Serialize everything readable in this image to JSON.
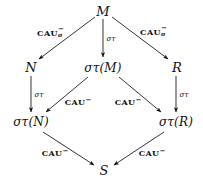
{
  "diagram": {
    "type": "commutative-diagram",
    "background_color": "#ffffff",
    "ink_color": "#111111",
    "nodes": [
      {
        "id": "M",
        "label": "M",
        "x": 103,
        "y": 11
      },
      {
        "id": "N",
        "label": "N",
        "x": 31,
        "y": 67
      },
      {
        "id": "sM",
        "label": "στ(M)",
        "x": 103,
        "y": 68
      },
      {
        "id": "R",
        "label": "R",
        "x": 177,
        "y": 67
      },
      {
        "id": "sN",
        "label": "στ(N)",
        "x": 31,
        "y": 122
      },
      {
        "id": "sR",
        "label": "στ(R)",
        "x": 176,
        "y": 122
      },
      {
        "id": "S",
        "label": "S",
        "x": 104,
        "y": 170
      }
    ],
    "edges": [
      {
        "id": "M-N",
        "from": "M",
        "to": "N",
        "label_kind": "cau-sigma",
        "label_text": "CAU",
        "sup": "−",
        "sub": "σ",
        "label_x": 50,
        "label_y": 32
      },
      {
        "id": "M-sM",
        "from": "M",
        "to": "sM",
        "label_kind": "sigma-tau",
        "label_text": "στ",
        "label_x": 111,
        "label_y": 39
      },
      {
        "id": "M-R",
        "from": "M",
        "to": "R",
        "label_kind": "cau-sigma",
        "label_text": "CAU",
        "sup": "−",
        "sub": "σ",
        "label_x": 153,
        "label_y": 31
      },
      {
        "id": "N-sN",
        "from": "N",
        "to": "sN",
        "label_kind": "sigma-tau",
        "label_text": "στ",
        "label_x": 39,
        "label_y": 95
      },
      {
        "id": "sM-sN",
        "from": "sM",
        "to": "sN",
        "label_kind": "cau",
        "label_text": "CAU",
        "sup": "−",
        "label_x": 78,
        "label_y": 101
      },
      {
        "id": "sM-sR",
        "from": "sM",
        "to": "sR",
        "label_kind": "cau",
        "label_text": "CAU",
        "sup": "−",
        "label_x": 128,
        "label_y": 101
      },
      {
        "id": "R-sR",
        "from": "R",
        "to": "sR",
        "label_kind": "sigma-tau",
        "label_text": "στ",
        "label_x": 184,
        "label_y": 95
      },
      {
        "id": "sN-S",
        "from": "sN",
        "to": "S",
        "label_kind": "cau",
        "label_text": "CAU",
        "sup": "−",
        "label_x": 55,
        "label_y": 152
      },
      {
        "id": "sR-S",
        "from": "sR",
        "to": "S",
        "label_kind": "cau",
        "label_text": "CAU",
        "sup": "−",
        "label_x": 152,
        "label_y": 152
      }
    ]
  }
}
